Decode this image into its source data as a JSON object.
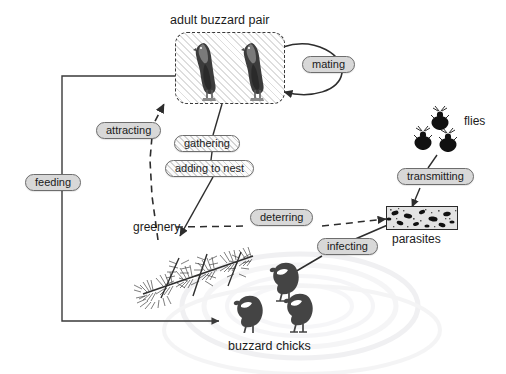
{
  "diagram": {
    "background_color": "#ffffff",
    "pill_fill": "#d8d8d8",
    "pill_stroke": "#6d6d6d",
    "edge_color": "#3a3a3a",
    "text_color": "#1b1b1b"
  },
  "entities": [
    {
      "id": "adult-buzzard-pair",
      "label": "adult buzzard pair",
      "icon": "buzzard-bird-icon",
      "count": 2,
      "boxed": true,
      "box_style": "dashed-hatched"
    },
    {
      "id": "flies",
      "label": "flies",
      "icon": "fly-insect-icon",
      "count": 3,
      "boxed": false
    },
    {
      "id": "parasites",
      "label": "parasites",
      "icon": "parasite-texture-icon",
      "count": 1,
      "boxed": true,
      "box_style": "solid-photo"
    },
    {
      "id": "greenery",
      "label": "greenery",
      "icon": "conifer-branch-icon",
      "count": 1,
      "boxed": false
    },
    {
      "id": "buzzard-chicks",
      "label": "buzzard chicks",
      "icon": "chick-bird-icon",
      "count": 3,
      "boxed": false
    }
  ],
  "relations": [
    {
      "id": "mating",
      "label": "mating",
      "from": "adult-buzzard-pair",
      "to": "adult-buzzard-pair",
      "style": "solid",
      "fill": "solid-gray"
    },
    {
      "id": "attracting",
      "label": "attracting",
      "from": "greenery",
      "to": "adult-buzzard-pair",
      "style": "dashed",
      "fill": "solid-gray"
    },
    {
      "id": "gathering",
      "label": "gathering",
      "from": "adult-buzzard-pair",
      "to": "greenery",
      "style": "solid",
      "fill": "hatched"
    },
    {
      "id": "adding-to-nest",
      "label": "adding to nest",
      "from": "adult-buzzard-pair",
      "to": "greenery",
      "style": "solid",
      "fill": "hatched"
    },
    {
      "id": "feeding",
      "label": "feeding",
      "from": "adult-buzzard-pair",
      "to": "buzzard-chicks",
      "style": "solid",
      "fill": "solid-gray"
    },
    {
      "id": "transmitting",
      "label": "transmitting",
      "from": "flies",
      "to": "parasites",
      "style": "solid",
      "fill": "solid-gray"
    },
    {
      "id": "deterring",
      "label": "deterring",
      "from": "greenery",
      "to": "parasites",
      "style": "dashed",
      "fill": "solid-gray"
    },
    {
      "id": "infecting",
      "label": "infecting",
      "from": "parasites",
      "to": "buzzard-chicks",
      "style": "solid",
      "fill": "solid-gray"
    }
  ]
}
